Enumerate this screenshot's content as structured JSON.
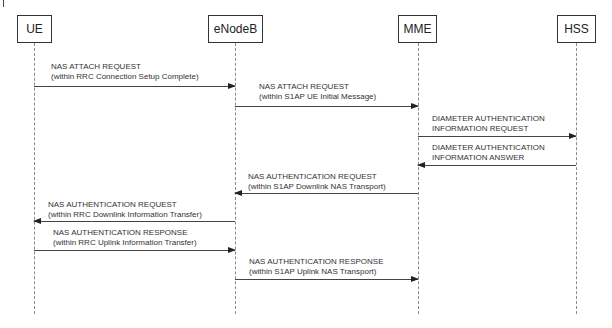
{
  "diagram": {
    "type": "sequence",
    "entities": [
      {
        "id": "ue",
        "label": "UE"
      },
      {
        "id": "enodeb",
        "label": "eNodeB"
      },
      {
        "id": "mme",
        "label": "MME"
      },
      {
        "id": "hss",
        "label": "HSS"
      }
    ],
    "messages": [
      {
        "from": "UE",
        "to": "eNodeB",
        "line1": "NAS ATTACH REQUEST",
        "line2": "(within RRC Connection Setup Complete)"
      },
      {
        "from": "eNodeB",
        "to": "MME",
        "line1": "NAS ATTACH REQUEST",
        "line2": "(within S1AP UE Initial Message)"
      },
      {
        "from": "MME",
        "to": "HSS",
        "line1": "DIAMETER AUTHENTICATION",
        "line2": "INFORMATION REQUEST"
      },
      {
        "from": "HSS",
        "to": "MME",
        "line1": "DIAMETER AUTHENTICATION",
        "line2": "INFORMATION ANSWER"
      },
      {
        "from": "MME",
        "to": "eNodeB",
        "line1": "NAS AUTHENTICATION REQUEST",
        "line2": "(within S1AP Downlink NAS Transport)"
      },
      {
        "from": "eNodeB",
        "to": "UE",
        "line1": "NAS AUTHENTICATION REQUEST",
        "line2": "(within RRC Downlink Information Transfer)"
      },
      {
        "from": "UE",
        "to": "eNodeB",
        "line1": "NAS AUTHENTICATION RESPONSE",
        "line2": "(within RRC Uplink Information Transfer)"
      },
      {
        "from": "eNodeB",
        "to": "MME",
        "line1": "NAS AUTHENTICATION RESPONSE",
        "line2": "(within S1AP Uplink NAS Transport)"
      }
    ]
  }
}
